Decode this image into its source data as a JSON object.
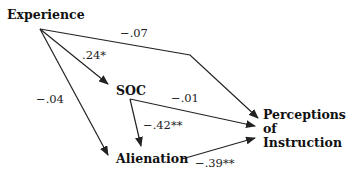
{
  "diagram": {
    "type": "path-diagram",
    "nodes": {
      "experience": "Experience",
      "soc": "SOC",
      "alienation": "Alienation",
      "perceptions": [
        "Perceptions",
        "of",
        "Instruction"
      ]
    },
    "edges": [
      {
        "from": "Experience",
        "to": "SOC",
        "coefficient": ".24*"
      },
      {
        "from": "Experience",
        "to": "Perceptions of Instruction",
        "coefficient": "−.07"
      },
      {
        "from": "Experience",
        "to": "Alienation",
        "coefficient": "−.04"
      },
      {
        "from": "SOC",
        "to": "Perceptions of Instruction",
        "coefficient": "−.01"
      },
      {
        "from": "SOC",
        "to": "Alienation",
        "coefficient": "−.42**"
      },
      {
        "from": "Alienation",
        "to": "Perceptions of Instruction",
        "coefficient": "−.39**"
      }
    ],
    "line_color": "#222222"
  }
}
